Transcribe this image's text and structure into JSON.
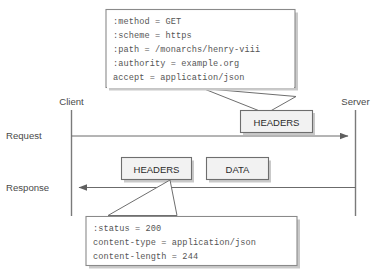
{
  "diagram": {
    "endpoints": {
      "client_label": "Client",
      "server_label": "Server"
    },
    "flows": [
      {
        "name": "request",
        "label": "Request",
        "direction": "client-to-server"
      },
      {
        "name": "response",
        "label": "Response",
        "direction": "server-to-client"
      }
    ],
    "frames": [
      {
        "id": "request-headers",
        "label": "HEADERS",
        "flow": "request"
      },
      {
        "id": "response-headers",
        "label": "HEADERS",
        "flow": "response"
      },
      {
        "id": "response-data",
        "label": "DATA",
        "flow": "response"
      }
    ],
    "callouts": [
      {
        "id": "request-headers-callout",
        "target": "request-headers",
        "lines": [
          ":method = GET",
          ":scheme = https",
          ":path = /monarchs/henry-viii",
          ":authority = example.org",
          "accept = application/json"
        ]
      },
      {
        "id": "response-headers-callout",
        "target": "response-headers",
        "lines": [
          ":status = 200",
          "content-type = application/json",
          "content-length = 244"
        ]
      }
    ],
    "colors": {
      "line": "#6b6b6b",
      "frame_fill": "#f2f2f2",
      "frame_stroke": "#6e6e6e",
      "callout_stroke": "#8a8a8a",
      "text": "#555555",
      "shadow": "#c9c9c9",
      "background": "#ffffff"
    }
  }
}
